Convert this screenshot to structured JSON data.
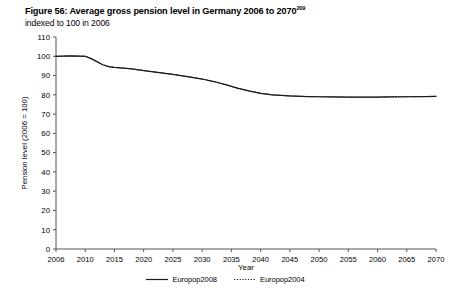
{
  "figure": {
    "title_main": "Figure 56: Average gross pension level in Germany 2006 to 2070",
    "title_footnote_marker": "209",
    "subtitle": "indexed to 100 in 2006"
  },
  "chart_data": {
    "type": "line",
    "title": "Figure 56: Average gross pension level in Germany 2006 to 2070",
    "subtitle": "indexed to 100 in 2006",
    "xlabel": "Year",
    "ylabel": "Pension level (2006 = 100)",
    "xlim": [
      2006,
      2070
    ],
    "ylim": [
      0,
      110
    ],
    "ytick_step": 10,
    "grid": false,
    "legend_position": "bottom-center",
    "yticks": [
      0,
      10,
      20,
      30,
      40,
      50,
      60,
      70,
      80,
      90,
      100,
      110
    ],
    "ytick_labels": [
      "0",
      "10",
      "20",
      "30",
      "40",
      "50",
      "60",
      "70",
      "80",
      "90",
      "100",
      "110"
    ],
    "xticks": [
      2006,
      2010,
      2015,
      2020,
      2025,
      2030,
      2035,
      2040,
      2045,
      2050,
      2055,
      2060,
      2065,
      2070
    ],
    "xtick_labels": [
      "2006",
      "2010",
      "2015",
      "2020",
      "2025",
      "2030",
      "2035",
      "2040",
      "2045",
      "2050",
      "2055",
      "2060",
      "2065",
      "2070"
    ],
    "x": [
      2006,
      2008,
      2010,
      2011,
      2012,
      2013,
      2014,
      2015,
      2016,
      2018,
      2020,
      2022,
      2025,
      2028,
      2030,
      2032,
      2034,
      2035,
      2036,
      2038,
      2040,
      2042,
      2045,
      2048,
      2050,
      2052,
      2055,
      2058,
      2060,
      2062,
      2065,
      2068,
      2070
    ],
    "series": [
      {
        "name": "Europop2008",
        "style": "solid",
        "color": "#1a1a1a",
        "values": [
          100.0,
          100.2,
          100.0,
          98.8,
          97.2,
          95.6,
          94.6,
          94.2,
          94.0,
          93.4,
          92.6,
          91.8,
          90.6,
          89.2,
          88.2,
          86.9,
          85.3,
          84.4,
          83.5,
          82.0,
          80.8,
          80.0,
          79.4,
          79.1,
          79.0,
          78.9,
          78.8,
          78.8,
          78.8,
          78.9,
          79.0,
          79.1,
          79.2
        ]
      },
      {
        "name": "Europop2004",
        "style": "dotted",
        "color": "#1a1a1a",
        "values": [
          100.0,
          100.2,
          100.0,
          98.8,
          97.2,
          95.6,
          94.6,
          94.2,
          94.0,
          93.4,
          92.6,
          91.8,
          90.6,
          89.2,
          88.2,
          86.9,
          85.3,
          84.4,
          83.5,
          82.0,
          80.8,
          80.0,
          79.4,
          79.1,
          79.0,
          78.9,
          78.8,
          78.8,
          78.8,
          78.9,
          79.0,
          79.1,
          79.2
        ]
      }
    ]
  },
  "legend": {
    "entries": [
      {
        "label": "Europop2008",
        "style": "solid"
      },
      {
        "label": "Europop2004",
        "style": "dotted"
      }
    ]
  },
  "colors": {
    "axis": "#555555",
    "line": "#1a1a1a",
    "text": "#000000",
    "background": "#ffffff"
  }
}
